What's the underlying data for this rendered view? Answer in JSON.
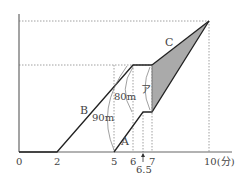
{
  "diagram": {
    "x_axis": {
      "unit": "(分)",
      "ticks": [
        {
          "label": "0",
          "x": 19
        },
        {
          "label": "2",
          "x": 57
        },
        {
          "label": "5",
          "x": 114
        },
        {
          "label": "6",
          "x": 133
        },
        {
          "label": "6.5",
          "x": 143
        },
        {
          "label": "7",
          "x": 152
        },
        {
          "label": "10(分)",
          "x": 209
        }
      ]
    },
    "lines": {
      "A": "A",
      "B": "B",
      "C": "C"
    },
    "annotations": {
      "dist_90": "90m",
      "dist_80": "80m",
      "area_a": "ア"
    }
  }
}
